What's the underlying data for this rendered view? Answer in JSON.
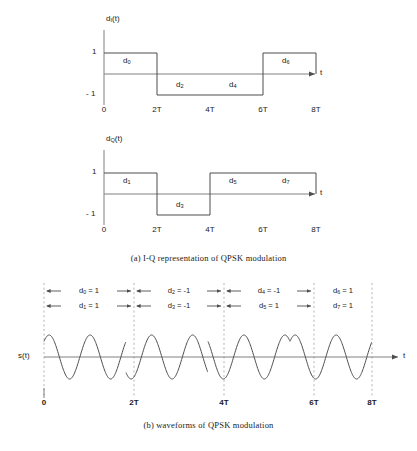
{
  "figure": {
    "caption_a": "(a)  I-Q representation of QPSK modulation",
    "caption_b": "(b)  waveforms of QPSK modulation",
    "colors": {
      "line": "#4d4d4d",
      "axis": "#808080",
      "dashed": "#b3b3b3",
      "text": "#1a1a1a",
      "background": "#ffffff"
    }
  },
  "panel_i": {
    "y_axis_label": "d",
    "y_axis_sub": "I",
    "y_axis_suffix": "(t)",
    "x_axis_label": "t",
    "y_ticks": [
      "1",
      "- 1"
    ],
    "x_ticks": [
      "0",
      "2T",
      "4T",
      "6T",
      "8T"
    ],
    "block_labels": [
      {
        "name": "d",
        "sub": "0"
      },
      {
        "name": "d",
        "sub": "2"
      },
      {
        "name": "d",
        "sub": "4"
      },
      {
        "name": "d",
        "sub": "6"
      }
    ]
  },
  "panel_q": {
    "y_axis_label": "d",
    "y_axis_sub": "Q",
    "y_axis_suffix": "(t)",
    "x_axis_label": "t",
    "y_ticks": [
      "1",
      "- 1"
    ],
    "x_ticks": [
      "0",
      "2T",
      "4T",
      "6T",
      "8T"
    ],
    "block_labels": [
      {
        "name": "d",
        "sub": "1"
      },
      {
        "name": "d",
        "sub": "3"
      },
      {
        "name": "d",
        "sub": "5"
      },
      {
        "name": "d",
        "sub": "7"
      }
    ]
  },
  "panel_s": {
    "y_axis_label": "s(t)",
    "x_axis_label": "t",
    "x_ticks": [
      "0",
      "2T",
      "4T",
      "6T",
      "8T"
    ],
    "annotations_row1": [
      {
        "name": "d",
        "sub": "0",
        "eq": "= 1"
      },
      {
        "name": "d",
        "sub": "2",
        "eq": "= -1"
      },
      {
        "name": "d",
        "sub": "4",
        "eq": "= -1"
      },
      {
        "name": "d",
        "sub": "6",
        "eq": "= 1"
      }
    ],
    "annotations_row2": [
      {
        "name": "d",
        "sub": "1",
        "eq": "= 1"
      },
      {
        "name": "d",
        "sub": "3",
        "eq": "= -1"
      },
      {
        "name": "d",
        "sub": "5",
        "eq": "= 1"
      },
      {
        "name": "d",
        "sub": "7",
        "eq": "= 1"
      }
    ]
  },
  "chart_data": {
    "type": "line",
    "xlabel": "t",
    "x_tick_labels": [
      "0",
      "2T",
      "4T",
      "6T",
      "8T"
    ],
    "x_tick_values": [
      0,
      2,
      4,
      6,
      8
    ],
    "symbol_period": 2,
    "series": [
      {
        "name": "d_I(t)",
        "ylabel": "d_I(t)",
        "ylim": [
          -1,
          1
        ],
        "y_tick_values": [
          1,
          -1
        ],
        "type": "nrz-step",
        "segments": [
          {
            "x_start": 0,
            "x_end": 2,
            "value": 1,
            "label": "d_0"
          },
          {
            "x_start": 2,
            "x_end": 4,
            "value": -1,
            "label": "d_2"
          },
          {
            "x_start": 4,
            "x_end": 6,
            "value": -1,
            "label": "d_4"
          },
          {
            "x_start": 6,
            "x_end": 8,
            "value": 1,
            "label": "d_6"
          }
        ]
      },
      {
        "name": "d_Q(t)",
        "ylabel": "d_Q(t)",
        "ylim": [
          -1,
          1
        ],
        "y_tick_values": [
          1,
          -1
        ],
        "type": "nrz-step",
        "segments": [
          {
            "x_start": 0,
            "x_end": 2,
            "value": 1,
            "label": "d_1"
          },
          {
            "x_start": 2,
            "x_end": 4,
            "value": -1,
            "label": "d_3"
          },
          {
            "x_start": 4,
            "x_end": 6,
            "value": 1,
            "label": "d_5"
          },
          {
            "x_start": 6,
            "x_end": 8,
            "value": 1,
            "label": "d_7"
          }
        ]
      },
      {
        "name": "s(t)",
        "ylabel": "s(t)",
        "type": "carrier",
        "cycles_per_symbol_interval": 2,
        "phase_discontinuities_at": [
          2,
          4,
          6
        ],
        "symbol_phases_deg": [
          45,
          225,
          135,
          45
        ]
      }
    ],
    "bit_values": {
      "d_0": 1,
      "d_1": 1,
      "d_2": -1,
      "d_3": -1,
      "d_4": -1,
      "d_5": 1,
      "d_6": 1,
      "d_7": 1
    },
    "grid": false,
    "legend": "none"
  }
}
